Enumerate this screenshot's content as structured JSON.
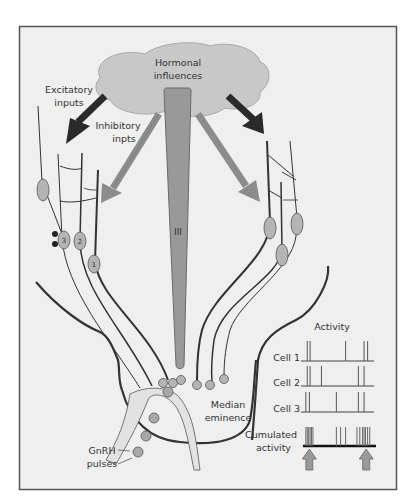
{
  "figure": {
    "colors": {
      "panel_bg": "#efefef",
      "frame": "#555555",
      "cloud": "#c8c8c8",
      "ventricle": "#999999",
      "inhibitory_arrow": "#8c8c8c",
      "excitatory_arrow": "#2a2a2a",
      "soma": "#b4b4b4",
      "axon": "#333333"
    },
    "labels": {
      "hormonal": [
        "Hormonal",
        "influences"
      ],
      "excitatory": [
        "Excitatory",
        "inputs"
      ],
      "inhibitory": [
        "Inhibitory",
        "inpts"
      ],
      "ventricle": "III",
      "median_eminence": [
        "Median",
        "eminence"
      ],
      "gnrh": [
        "GnRH",
        "pulses"
      ],
      "activity_title": "Activity",
      "cumulated": [
        "Cumulated",
        "activity"
      ]
    },
    "cell_numbers": [
      "3",
      "2",
      "1"
    ],
    "activity": {
      "rows": [
        {
          "label": "Cell 1",
          "spikes": [
            0.06,
            0.1,
            0.6,
            0.86,
            0.91
          ]
        },
        {
          "label": "Cell 2",
          "spikes": [
            0.06,
            0.1,
            0.26,
            0.78,
            0.86
          ]
        },
        {
          "label": "Cell 3",
          "spikes": [
            0.04,
            0.09,
            0.47,
            0.78,
            0.86
          ]
        }
      ],
      "cumulated_spikes": [
        0.04,
        0.06,
        0.08,
        0.1,
        0.12,
        0.14,
        0.47,
        0.53,
        0.6,
        0.76,
        0.8,
        0.84,
        0.86,
        0.88,
        0.91,
        0.94
      ],
      "pulse_arrows": [
        0.09,
        0.89
      ]
    }
  }
}
